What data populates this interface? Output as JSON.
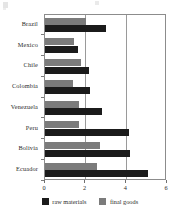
{
  "chart_data": {
    "type": "bar",
    "orientation": "horizontal",
    "title": "",
    "xlabel": "",
    "ylabel": "",
    "xlim": [
      0,
      6
    ],
    "xticks": [
      0,
      2,
      4,
      6
    ],
    "xtick_labels": [
      "0",
      "2",
      "4",
      "6"
    ],
    "grid": true,
    "gridlines_at": [
      2,
      4
    ],
    "legend_position": "bottom",
    "categories": [
      "Brazil",
      "Mexico",
      "Chile",
      "Colombia",
      "Venezuela",
      "Peru",
      "Bolivia",
      "Ecuador"
    ],
    "series": [
      {
        "name": "raw materials",
        "color": "#1b1b1b",
        "values": [
          3.0,
          1.6,
          2.15,
          2.2,
          2.8,
          4.15,
          4.2,
          5.05
        ]
      },
      {
        "name": "final goods",
        "color": "#7b7b7b",
        "values": [
          2.0,
          1.45,
          1.75,
          1.4,
          1.65,
          1.65,
          2.7,
          2.55
        ]
      }
    ]
  },
  "legend": {
    "items": [
      {
        "label": "raw materials",
        "color": "#1b1b1b",
        "icon": "square-swatch-black"
      },
      {
        "label": "final goods",
        "color": "#7b7b7b",
        "icon": "square-swatch-gray"
      }
    ]
  },
  "colors": {
    "raw_materials": "#1b1b1b",
    "final_goods": "#7b7b7b",
    "axis": "#8c8c8c",
    "gridline": "#9a9a9a",
    "text": "#2b2b2b",
    "background": "#ffffff"
  }
}
